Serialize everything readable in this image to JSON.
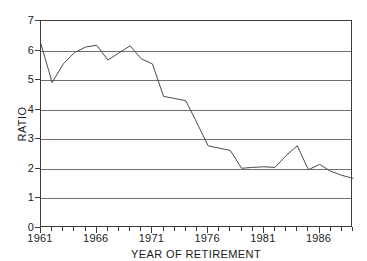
{
  "chart_data": {
    "type": "line",
    "title": "",
    "xlabel": "YEAR OF RETIREMENT",
    "ylabel": "RATIO",
    "xlim": [
      1961,
      1989
    ],
    "ylim": [
      0,
      7
    ],
    "grid": true,
    "legend": "none",
    "x_tick_labels": [
      "1961",
      "1966",
      "1971",
      "1976",
      "1981",
      "1986"
    ],
    "x_tick_values": [
      1961,
      1966,
      1971,
      1976,
      1981,
      1986
    ],
    "x_minor_tick_step": 1,
    "y_tick_labels": [
      "0",
      "1",
      "2",
      "3",
      "4",
      "5",
      "6",
      "7"
    ],
    "y_tick_values": [
      0,
      1,
      2,
      3,
      4,
      5,
      6,
      7
    ],
    "gridline_values": [
      1,
      2,
      3,
      4,
      5,
      6
    ],
    "series": [
      {
        "name": "ratio",
        "color": "#4a4a4a",
        "x": [
          1961,
          1962,
          1963,
          1964,
          1965,
          1966,
          1967,
          1968,
          1969,
          1970,
          1971,
          1972,
          1973,
          1974,
          1975,
          1976,
          1977,
          1978,
          1979,
          1980,
          1981,
          1982,
          1983,
          1984,
          1985,
          1986,
          1987,
          1988,
          1989
        ],
        "values": [
          6.22,
          4.92,
          5.55,
          5.93,
          6.12,
          6.18,
          5.68,
          5.92,
          6.16,
          5.72,
          5.55,
          4.45,
          4.38,
          4.3,
          3.55,
          2.78,
          2.7,
          2.62,
          2.02,
          2.05,
          2.07,
          2.05,
          2.45,
          2.78,
          1.97,
          2.15,
          1.92,
          1.78,
          1.68
        ]
      }
    ]
  }
}
